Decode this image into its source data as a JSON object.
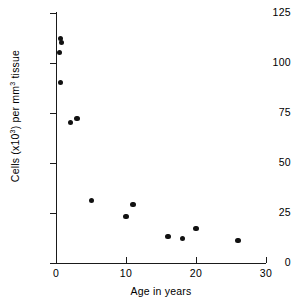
{
  "chart_data": {
    "type": "scatter",
    "title": "",
    "xlabel": "Age in years",
    "ylabel": "Cells (x10³) per mm³ tissue",
    "ylabel_parts": {
      "prefix": "Cells (x10",
      "exp1": "3",
      "middle": ") per mm",
      "exp2": "3",
      "suffix": " tissue"
    },
    "xlim": [
      0,
      30
    ],
    "ylim": [
      0,
      125
    ],
    "xticks": [
      0,
      10,
      20,
      30
    ],
    "yticks": [
      0,
      25,
      50,
      75,
      100,
      125
    ],
    "xtick_labels": [
      "0",
      "10",
      "20",
      "30"
    ],
    "ytick_labels": [
      "0",
      "25",
      "50",
      "75",
      "100",
      "125"
    ],
    "grid": false,
    "legend": false,
    "marker": "filled-circle",
    "marker_color": "#111111",
    "axis_color": "#1a1a1a",
    "points": [
      {
        "x": 0.6,
        "y": 112
      },
      {
        "x": 0.8,
        "y": 110
      },
      {
        "x": 0.5,
        "y": 105
      },
      {
        "x": 0.6,
        "y": 90
      },
      {
        "x": 2.1,
        "y": 70
      },
      {
        "x": 3.0,
        "y": 72
      },
      {
        "x": 5.1,
        "y": 31
      },
      {
        "x": 10.0,
        "y": 23
      },
      {
        "x": 11.0,
        "y": 29
      },
      {
        "x": 16.0,
        "y": 13
      },
      {
        "x": 18.1,
        "y": 12
      },
      {
        "x": 20.0,
        "y": 17
      },
      {
        "x": 26.0,
        "y": 11
      }
    ]
  }
}
